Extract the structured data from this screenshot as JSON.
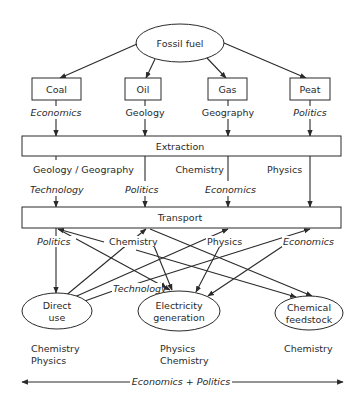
{
  "diagram": {
    "root": {
      "label": "Fossil fuel"
    },
    "fuels": [
      {
        "label": "Coal",
        "factor": "Economics",
        "factor_italic": true
      },
      {
        "label": "Oil",
        "factor": "Geology",
        "factor_italic": false
      },
      {
        "label": "Gas",
        "factor": "Geography",
        "factor_italic": false
      },
      {
        "label": "Peat",
        "factor": "Politics",
        "factor_italic": true
      }
    ],
    "extraction": {
      "label": "Extraction",
      "science_labels": [
        "Geology / Geography",
        "Chemistry",
        "Physics"
      ],
      "factor_labels": [
        "Technology",
        "Politics",
        "Economics"
      ]
    },
    "transport": {
      "label": "Transport",
      "factor_labels": [
        "Politics",
        "Chemistry",
        "Physics",
        "Economics",
        "Technology"
      ]
    },
    "uses": [
      {
        "label_line1": "Direct",
        "label_line2": "use",
        "sciences": [
          "Chemistry",
          "Physics"
        ]
      },
      {
        "label_line1": "Electricity",
        "label_line2": "generation",
        "sciences": [
          "Physics",
          "Chemistry"
        ]
      },
      {
        "label_line1": "Chemical",
        "label_line2": "feedstock",
        "sciences": [
          "Chemistry"
        ]
      }
    ],
    "footer": {
      "label": "Economics + Politics"
    }
  }
}
